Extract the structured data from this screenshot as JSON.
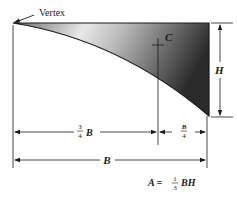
{
  "figure": {
    "type": "spandrel-area-diagram",
    "colors": {
      "line": "#1a1a1a",
      "shade_dark": "#2a2a2a",
      "shade_light": "#ffffff"
    },
    "labels": {
      "vertex": "Vertex",
      "centroid": "C",
      "height": "H",
      "three_quarter_num": "3",
      "three_quarter_den": "4",
      "three_quarter_var": "B",
      "quarter_num": "B",
      "quarter_den": "4",
      "base": "B"
    },
    "formula": {
      "lhs": "A =",
      "frac_num": "1",
      "frac_den": "3",
      "rhs": "BH"
    }
  }
}
